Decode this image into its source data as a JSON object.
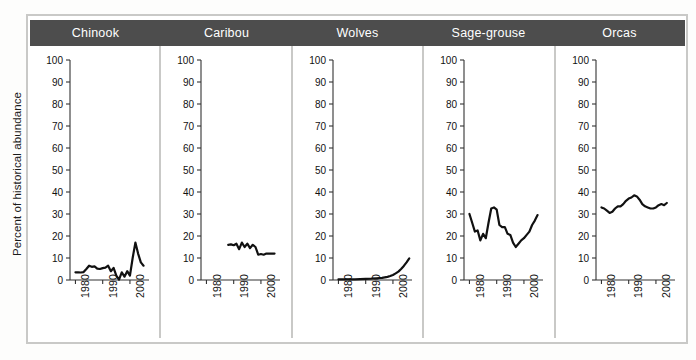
{
  "figure": {
    "ylabel": "Percent of historical abundance"
  },
  "chart_data": {
    "type": "line",
    "title": "",
    "subtitle": "",
    "ylabel": "Percent of historical abundance",
    "xlabel": "",
    "ylim": [
      0,
      100
    ],
    "xlim": [
      1978,
      2007
    ],
    "yticks": [
      0,
      10,
      20,
      30,
      40,
      50,
      60,
      70,
      80,
      90,
      100
    ],
    "ytick_labels": [
      "0",
      "10",
      "20",
      "30",
      "40",
      "50",
      "60",
      "70",
      "80",
      "90",
      "100"
    ],
    "xticks": [
      1980,
      1990,
      2000
    ],
    "xtick_labels": [
      "1980",
      "1990",
      "2000"
    ],
    "grid": false,
    "legend": "none",
    "layout": "small-multiples, 5 panels side-by-side, shared y-axis 0-100",
    "line_color": "#111111",
    "panels": [
      {
        "name": "Chinook",
        "x": [
          1980,
          1981,
          1982,
          1983,
          1984,
          1985,
          1986,
          1987,
          1988,
          1989,
          1990,
          1991,
          1992,
          1993,
          1994,
          1995,
          1996,
          1997,
          1998,
          1999,
          2000,
          2001,
          2002,
          2003,
          2004,
          2005
        ],
        "values": [
          3.5,
          3.5,
          3.4,
          3.6,
          5.0,
          6.5,
          6.0,
          6.2,
          5.2,
          5.0,
          5.4,
          5.6,
          6.5,
          4.0,
          5.5,
          2.0,
          0.2,
          3.5,
          1.5,
          4.0,
          2.0,
          10.0,
          17.0,
          12.0,
          8.0,
          6.5
        ]
      },
      {
        "name": "Caribou",
        "x": [
          1988,
          1989,
          1990,
          1991,
          1992,
          1993,
          1994,
          1995,
          1996,
          1997,
          1998,
          1999,
          2000,
          2001,
          2002,
          2003,
          2004,
          2005
        ],
        "values": [
          16.0,
          16.2,
          15.8,
          16.5,
          14.0,
          17.0,
          15.0,
          16.5,
          14.5,
          16.0,
          15.0,
          11.5,
          11.8,
          11.5,
          12.0,
          12.0,
          12.0,
          12.0
        ]
      },
      {
        "name": "Wolves",
        "x": [
          1980,
          1982,
          1984,
          1986,
          1988,
          1990,
          1992,
          1994,
          1996,
          1998,
          1999,
          2000,
          2001,
          2002,
          2003,
          2004,
          2005,
          2006
        ],
        "values": [
          0.3,
          0.3,
          0.3,
          0.3,
          0.4,
          0.5,
          0.6,
          0.8,
          1.0,
          1.4,
          1.8,
          2.3,
          3.0,
          3.8,
          5.0,
          6.4,
          8.0,
          9.8
        ]
      },
      {
        "name": "Sage-grouse",
        "x": [
          1980,
          1981,
          1982,
          1983,
          1984,
          1985,
          1986,
          1987,
          1988,
          1989,
          1990,
          1991,
          1992,
          1993,
          1994,
          1995,
          1996,
          1997,
          1998,
          1999,
          2000,
          2001,
          2002,
          2003,
          2004,
          2005
        ],
        "values": [
          30.0,
          26.0,
          22.0,
          22.5,
          18.0,
          21.0,
          19.0,
          26.0,
          32.5,
          33.0,
          32.0,
          25.0,
          24.0,
          24.0,
          21.0,
          20.5,
          17.0,
          15.0,
          16.5,
          18.0,
          19.0,
          20.5,
          22.0,
          25.0,
          27.0,
          29.5
        ]
      },
      {
        "name": "Orcas",
        "x": [
          1980,
          1981,
          1982,
          1983,
          1984,
          1985,
          1986,
          1987,
          1988,
          1989,
          1990,
          1991,
          1992,
          1993,
          1994,
          1995,
          1996,
          1997,
          1998,
          1999,
          2000,
          2001,
          2002,
          2003,
          2004
        ],
        "values": [
          33.0,
          32.5,
          31.5,
          30.5,
          31.0,
          32.5,
          33.5,
          33.5,
          34.5,
          36.0,
          37.0,
          37.5,
          38.5,
          38.0,
          36.5,
          34.5,
          33.5,
          33.0,
          32.5,
          32.5,
          33.0,
          34.0,
          34.5,
          34.0,
          35.0
        ]
      }
    ]
  }
}
